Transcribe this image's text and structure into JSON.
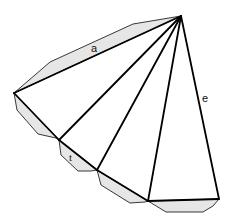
{
  "diagram": {
    "colors": {
      "background": "#ffffff",
      "flap_fill": "#e6e6e6",
      "edge": "#000000"
    },
    "apex": [
      181,
      16
    ],
    "base_vertices": [
      [
        14,
        93
      ],
      [
        59,
        140
      ],
      [
        97,
        170
      ],
      [
        148,
        201
      ],
      [
        219,
        199
      ]
    ],
    "flaps": [
      {
        "points": "14,93 50,62 133,24 181,16"
      },
      {
        "points": "14,93 17,110 38,134 56,138 59,140"
      },
      {
        "points": "59,140 61,155 78,171 91,171 97,170"
      },
      {
        "points": "97,170 101,185 130,203 145,202 148,201"
      },
      {
        "points": "148,201 166,212 203,212 213,206 219,199"
      }
    ],
    "labels": {
      "slant_edge": "a",
      "flap_tab": "t",
      "right_edge": "e"
    }
  }
}
